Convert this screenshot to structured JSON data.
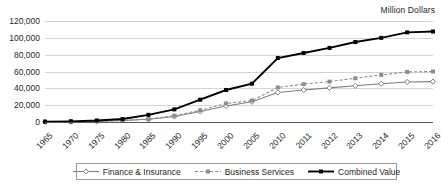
{
  "chart": {
    "axis_title": "Million Dollars",
    "legend": {
      "items": [
        {
          "label": "Finance & Insurance",
          "color": "#7f7f7f",
          "style": "solid",
          "marker": "diamond"
        },
        {
          "label": "Business Services",
          "color": "#8c8c8c",
          "style": "dashed",
          "marker": "square"
        },
        {
          "label": "Combined Value",
          "color": "#000000",
          "style": "solid-thick",
          "marker": "square"
        }
      ]
    }
  },
  "chart_data": {
    "type": "line",
    "title": "",
    "subtitle": "",
    "xlabel": "",
    "ylabel": "Million Dollars",
    "ylim": [
      0,
      120000
    ],
    "ytick_labels": [
      "0",
      "20,000",
      "40,000",
      "60,000",
      "80,000",
      "100,000",
      "120,000"
    ],
    "ytick_values": [
      0,
      20000,
      40000,
      60000,
      80000,
      100000,
      120000
    ],
    "grid": true,
    "legend_position": "bottom",
    "categories": [
      "1965",
      "1970",
      "1975",
      "1980",
      "1985",
      "1990",
      "1995",
      "2000",
      "2005",
      "2010",
      "2011",
      "2012",
      "2013",
      "2014",
      "2015",
      "2016"
    ],
    "series": [
      {
        "name": "Finance & Insurance",
        "color": "#7f7f7f",
        "style": "solid",
        "marker": "diamond",
        "values": [
          200,
          400,
          900,
          1800,
          3200,
          6500,
          12500,
          19000,
          24000,
          35000,
          38000,
          40500,
          43000,
          45500,
          47500,
          48000
        ]
      },
      {
        "name": "Business Services",
        "color": "#8c8c8c",
        "style": "dashed",
        "marker": "square",
        "values": [
          200,
          400,
          900,
          1700,
          3500,
          7500,
          14000,
          22000,
          25500,
          41000,
          45000,
          48000,
          52000,
          56000,
          59500,
          60000
        ]
      },
      {
        "name": "Combined Value",
        "color": "#000000",
        "style": "solid-thick",
        "marker": "square",
        "values": [
          400,
          800,
          1800,
          3500,
          8500,
          15000,
          26500,
          38000,
          45500,
          76000,
          82000,
          88000,
          95000,
          100000,
          106500,
          107500
        ]
      }
    ]
  }
}
